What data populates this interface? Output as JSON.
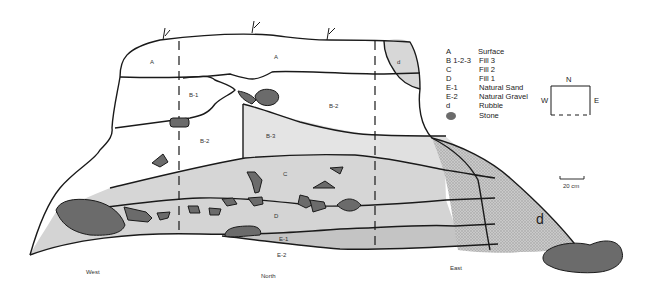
{
  "diagram": {
    "type": "stratigraphic-section",
    "layer_labels": {
      "A_left": "A",
      "A_center": "A",
      "d_top": "d",
      "B1": "B-1",
      "B2_left": "B-2",
      "B2_right": "B-2",
      "B3": "B-3",
      "C": "C",
      "D": "D",
      "E1": "E-1",
      "E2": "E-2",
      "d_rubble": "d"
    },
    "directions": {
      "west": "West",
      "north": "North",
      "east": "East"
    },
    "legend": {
      "items": [
        {
          "code": "A",
          "desc": "Surface"
        },
        {
          "code": "B 1-2-3",
          "desc": "Fill 3"
        },
        {
          "code": "C",
          "desc": "Fill 2"
        },
        {
          "code": "D",
          "desc": "Fill 1"
        },
        {
          "code": "E-1",
          "desc": "Natural Sand"
        },
        {
          "code": "E-2",
          "desc": "Natural Gravel"
        },
        {
          "code": "d",
          "desc": "Rubble"
        },
        {
          "code": "",
          "desc": "Stone"
        }
      ]
    },
    "compass": {
      "n": "N",
      "w": "W",
      "e": "E"
    },
    "scale_bar": {
      "label": "20 cm"
    },
    "colors": {
      "white": "#ffffff",
      "b3": "#e4e4e4",
      "c": "#d2d2d2",
      "d": "#d4d4d4",
      "e1": "#c4c4c4",
      "rubble": "#bdbdbd",
      "stone": "#6b6b6b"
    }
  }
}
